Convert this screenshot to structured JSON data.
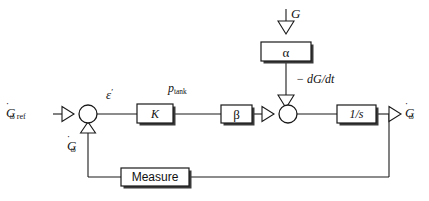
{
  "diagram": {
    "line_color": "#1a1a1a",
    "background": "#ffffff",
    "signals": {
      "reference_input": "Ġω ref",
      "feedback_signal": "Ġω",
      "error_signal": "ε'",
      "tank_pressure": "p tank",
      "disturbance_input": "G",
      "disturbance_derivative": "− dG/dt",
      "output": "Ġω"
    },
    "blocks": [
      {
        "id": "gain-k",
        "label": "K",
        "x": 137,
        "y": 104,
        "w": 36,
        "h": 19
      },
      {
        "id": "beta",
        "label": "β",
        "x": 221,
        "y": 105,
        "w": 31,
        "h": 18
      },
      {
        "id": "alpha",
        "label": "α",
        "x": 261,
        "y": 42,
        "w": 50,
        "h": 19
      },
      {
        "id": "integrator",
        "label": "1/s",
        "x": 337,
        "y": 105,
        "w": 39,
        "h": 18
      },
      {
        "id": "measure",
        "label": "Measure",
        "x": 121,
        "y": 168,
        "w": 68,
        "h": 18
      }
    ],
    "summing_junctions": [
      {
        "id": "sum-error",
        "cx": 88,
        "cy": 114,
        "r": 9
      },
      {
        "id": "sum-disturbance",
        "cx": 288,
        "cy": 114,
        "r": 9
      }
    ],
    "labels": {
      "ref_main": "G",
      "ref_dot": "̇",
      "ref_sub": "ω ref",
      "fb_sub": "ω",
      "epsilon": "ε",
      "epsilon_prime": "′",
      "p_main": "p",
      "p_sub": "tank",
      "G_top": "G",
      "dGdt": "− dG/dt",
      "out_sub": "ω",
      "K": "K",
      "beta": "β",
      "alpha": "α",
      "one_over_s": "1/s",
      "measure": "Measure"
    }
  }
}
